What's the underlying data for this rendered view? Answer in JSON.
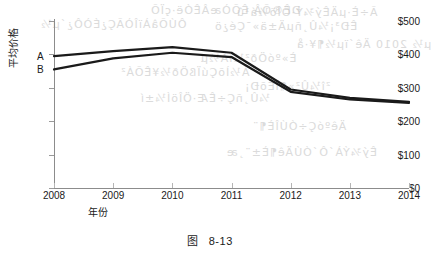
{
  "caption": {
    "prefix": "图",
    "number": "8-13"
  },
  "bleed_text": [
    {
      "text": "ÐÊ®ÕÂ ÊÕÒæÂÊÓë·çÏÕ",
      "x": 150,
      "y": 4
    },
    {
      "text": "Ã÷È·µÄÊý¾Ý·ÖÎö½á¹û",
      "x": 236,
      "y": 6
    },
    {
      "text": "ÔÚÕâÀïÎÒÃÇ¿ÉÒÔ¿´µ½",
      "x": 40,
      "y": 18
    },
    {
      "text": "ÊÐ³¡¼Û¸ñµÄ±ä»¯Çé¿ö",
      "x": 214,
      "y": 20
    },
    {
      "text": "µ½ 2010 Äê´ïµ½¶¥·å",
      "x": 296,
      "y": 38
    },
    {
      "text": "È»ºóÖð²½ÏÂ½µ",
      "x": 200,
      "y": 52
    },
    {
      "text": "Á½ÌõÇúÏßÖð½¥ÊÕÁ²",
      "x": 120,
      "y": 66
    },
    {
      "text": "²î¼Û²»¶ÏËõÐ¡",
      "x": 244,
      "y": 80
    },
    {
      "text": "¼Û¸ñÇ÷ÊÆ·ÖÎöÍ¼±í",
      "x": 140,
      "y": 92
    },
    {
      "text": "ÄêºóÇ÷ÓÚÎÈ¶¨",
      "x": 252,
      "y": 120
    },
    {
      "text": "Êý¾ÝÀ´Ô´ÓÚÄê¶È±¨¸æ",
      "x": 226,
      "y": 146
    }
  ],
  "chart_data": {
    "type": "line",
    "title": "",
    "xlabel": "年份",
    "ylabel": "平均价格",
    "x": [
      2008,
      2009,
      2010,
      2011,
      2012,
      2013,
      2014
    ],
    "xticklabels": [
      "2008",
      "2009",
      "2010",
      "2011",
      "2012",
      "2013",
      "2014"
    ],
    "yticks": [
      0,
      100,
      200,
      300,
      400,
      500
    ],
    "yticklabels": [
      "$0",
      "$100",
      "$200",
      "$300",
      "$400",
      "$500"
    ],
    "ylim": [
      0,
      500
    ],
    "xlim": [
      2008,
      2014
    ],
    "grid": false,
    "legend_position": "inline-left",
    "series": [
      {
        "name": "A",
        "label": "A",
        "color": "#1a1a1a",
        "values": [
          395,
          410,
          422,
          405,
          295,
          270,
          258
        ]
      },
      {
        "name": "B",
        "label": "B",
        "color": "#1a1a1a",
        "values": [
          355,
          388,
          405,
          392,
          288,
          265,
          255
        ]
      }
    ]
  }
}
